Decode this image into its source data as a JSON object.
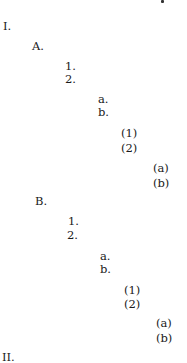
{
  "document": {
    "type": "outline-format-example",
    "items": [
      {
        "label": "I.",
        "level": 1,
        "x": 3,
        "y": 20
      },
      {
        "label": "A.",
        "level": 2,
        "x": 32,
        "y": 40
      },
      {
        "label": "1.",
        "level": 3,
        "x": 65,
        "y": 60
      },
      {
        "label": "2.",
        "level": 3,
        "x": 65,
        "y": 73
      },
      {
        "label": "a.",
        "level": 4,
        "x": 98,
        "y": 93
      },
      {
        "label": "b.",
        "level": 4,
        "x": 98,
        "y": 106
      },
      {
        "label": "(1)",
        "level": 5,
        "x": 121,
        "y": 127
      },
      {
        "label": "(2)",
        "level": 5,
        "x": 121,
        "y": 142
      },
      {
        "label": "(a)",
        "level": 6,
        "x": 153,
        "y": 162
      },
      {
        "label": "(b)",
        "level": 6,
        "x": 153,
        "y": 177
      },
      {
        "label": "B.",
        "level": 2,
        "x": 35,
        "y": 195
      },
      {
        "label": "1.",
        "level": 3,
        "x": 68,
        "y": 215
      },
      {
        "label": "2.",
        "level": 3,
        "x": 67,
        "y": 229
      },
      {
        "label": "a.",
        "level": 4,
        "x": 100,
        "y": 250
      },
      {
        "label": "b.",
        "level": 4,
        "x": 100,
        "y": 263
      },
      {
        "label": "(1)",
        "level": 5,
        "x": 124,
        "y": 284
      },
      {
        "label": "(2)",
        "level": 5,
        "x": 124,
        "y": 298
      },
      {
        "label": "(a)",
        "level": 6,
        "x": 156,
        "y": 317
      },
      {
        "label": "(b)",
        "level": 6,
        "x": 156,
        "y": 332
      },
      {
        "label": "II.",
        "level": 1,
        "x": 2,
        "y": 351
      }
    ]
  }
}
